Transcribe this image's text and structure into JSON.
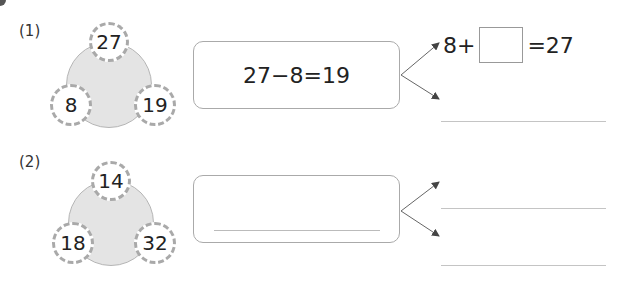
{
  "problems": [
    {
      "label": "(1)",
      "circles": {
        "top": "27",
        "left": "8",
        "right": "19"
      },
      "equation": "27−8=19",
      "answers": [
        {
          "prefix": "8+",
          "suffix": "=27",
          "box": ""
        },
        {
          "text": ""
        }
      ]
    },
    {
      "label": "(2)",
      "circles": {
        "top": "14",
        "left": "18",
        "right": "32"
      },
      "equation": "",
      "answers": [
        {
          "text": ""
        },
        {
          "text": ""
        }
      ]
    }
  ],
  "colors": {
    "circle_fill": "#e4e4e4",
    "dashed_border": "#a9a9a9",
    "box_border": "#aaaaaa",
    "line": "#c4c4c4"
  }
}
